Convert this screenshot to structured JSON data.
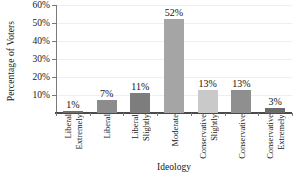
{
  "chart_data": {
    "type": "bar",
    "title": "",
    "xlabel": "Ideology",
    "ylabel": "Percentage of Voters",
    "categories": [
      "Extremely Liberal",
      "Liberal",
      "Slightly Liberal",
      "Moderate",
      "Slightly Conservative",
      "Conservative",
      "Extremely Conservative"
    ],
    "category_lines": [
      [
        "Extremely",
        "Liberal"
      ],
      [
        "Liberal"
      ],
      [
        "Slightly",
        "Liberal"
      ],
      [
        "Moderate"
      ],
      [
        "Slightly",
        "Conservative"
      ],
      [
        "Conservative"
      ],
      [
        "Extremely",
        "Conservative"
      ]
    ],
    "values": [
      1,
      7,
      11,
      52,
      13,
      13,
      3
    ],
    "value_labels": [
      "1%",
      "7%",
      "11%",
      "52%",
      "13%",
      "13%",
      "3%"
    ],
    "bar_colors": [
      "#6e6e6e",
      "#8c8c8c",
      "#7d7d7d",
      "#a5a5a5",
      "#c9c9c9",
      "#8f8f8f",
      "#6b6b6b"
    ],
    "ylim": [
      0,
      60
    ],
    "yticks": [
      10,
      20,
      30,
      40,
      50,
      60
    ],
    "ytick_labels": [
      "10%",
      "20%",
      "30%",
      "40%",
      "50%",
      "60%"
    ],
    "grid": true,
    "legend": "none",
    "axis_color": "#4a4a4a",
    "gridline_color": "#efefef",
    "background": "#ffffff"
  }
}
